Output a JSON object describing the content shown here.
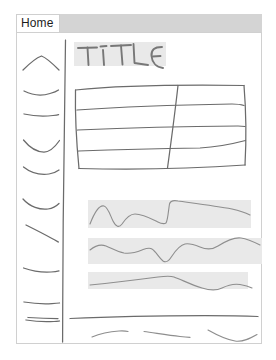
{
  "window": {
    "title": "Home",
    "type": "hand-drawn-wireframe-sketch"
  },
  "browser_chrome": {
    "tab_label": "Home",
    "tab_bar_color": "#d4d4d4",
    "tab_active_color": "#ffffff"
  },
  "page": {
    "frame_border_color": "#d0d0d0",
    "background": "#ffffff"
  },
  "sidebar": {
    "name": "navigation-sidebar",
    "items": [
      {
        "label": "",
        "sketch": "chevron-stroke",
        "y": 62
      },
      {
        "label": "",
        "sketch": "curve-stroke",
        "y": 88
      },
      {
        "label": "",
        "sketch": "straight-stroke",
        "y": 112
      },
      {
        "label": "",
        "sketch": "arc-stroke",
        "y": 141
      },
      {
        "label": "",
        "sketch": "arc-stroke",
        "y": 167
      },
      {
        "label": "",
        "sketch": "arc-stroke",
        "y": 199
      },
      {
        "label": "",
        "sketch": "slant-stroke",
        "y": 228
      },
      {
        "label": "",
        "sketch": "curve-stroke",
        "y": 268
      },
      {
        "label": "",
        "sketch": "straight-stroke",
        "y": 300
      }
    ],
    "divider": "hand-drawn-vertical-line"
  },
  "main": {
    "heading": {
      "text": "TITLE",
      "style": "hand-lettered",
      "highlight_color": "#e9e9e9"
    },
    "table": {
      "name": "sketched-data-table",
      "row_lines": 4,
      "column_dividers": 1,
      "columns": 2,
      "rows": 5,
      "style": "hand-drawn"
    },
    "text_blocks": [
      {
        "name": "paragraph-block-1",
        "highlight_color": "#e9e9e9",
        "squiggle_lines": 1,
        "width_pct": 66
      },
      {
        "name": "paragraph-block-2",
        "highlight_color": "#e9e9e9",
        "squiggle_lines": 1,
        "width_pct": 71
      },
      {
        "name": "paragraph-block-3",
        "highlight_color": "#e9e9e9",
        "squiggle_lines": 1,
        "width_pct": 65
      }
    ]
  },
  "footer": {
    "name": "page-footer",
    "divider": "horizontal-rule",
    "dash_segments": 3
  },
  "colors": {
    "ink": "#6b6b6b",
    "ink_light": "#8e8e8e",
    "band": "#e9e9e9",
    "chrome": "#d4d4d4",
    "frame": "#d0d0d0"
  }
}
